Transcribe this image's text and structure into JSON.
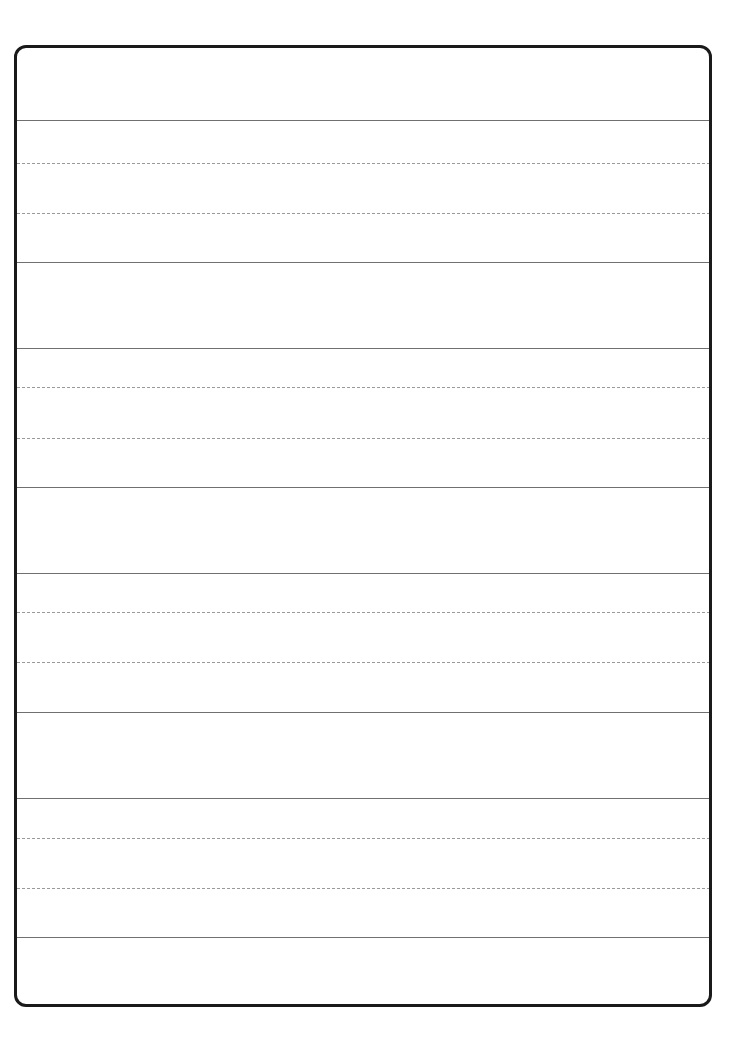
{
  "document": {
    "kind": "handwriting-practice-worksheet",
    "title": "Handwriting Practice Worksheet",
    "page_width": 745,
    "page_height": 1044,
    "background_color": "#ffffff",
    "content_text": ""
  },
  "frame": {
    "name": "worksheet-border",
    "left": 14,
    "top": 45,
    "width": 698,
    "height": 962,
    "border_width": 3,
    "border_color": "#1a1a1a",
    "corner_radius": 12,
    "fill_color": "#ffffff"
  },
  "styles": {
    "solid_rule": {
      "color": "#707070",
      "width": 1,
      "style": "solid"
    },
    "dashed_rule": {
      "color": "#9a9a9a",
      "width": 1,
      "style": "dashed",
      "dash_length": 3,
      "dash_gap": 2
    }
  },
  "rules": [
    {
      "name": "writing-row-1-top",
      "y": 120,
      "style": "solid"
    },
    {
      "name": "writing-row-1-midline-1",
      "y": 163,
      "style": "dashed"
    },
    {
      "name": "writing-row-1-midline-2",
      "y": 213,
      "style": "dashed"
    },
    {
      "name": "writing-row-1-baseline",
      "y": 262,
      "style": "solid"
    },
    {
      "name": "writing-row-2-top",
      "y": 348,
      "style": "solid"
    },
    {
      "name": "writing-row-2-midline-1",
      "y": 387,
      "style": "dashed"
    },
    {
      "name": "writing-row-2-midline-2",
      "y": 438,
      "style": "dashed"
    },
    {
      "name": "writing-row-2-baseline",
      "y": 487,
      "style": "solid"
    },
    {
      "name": "writing-row-3-top",
      "y": 573,
      "style": "solid"
    },
    {
      "name": "writing-row-3-midline-1",
      "y": 612,
      "style": "dashed"
    },
    {
      "name": "writing-row-3-midline-2",
      "y": 662,
      "style": "dashed"
    },
    {
      "name": "writing-row-3-baseline",
      "y": 712,
      "style": "solid"
    },
    {
      "name": "writing-row-4-top",
      "y": 798,
      "style": "solid"
    },
    {
      "name": "writing-row-4-midline-1",
      "y": 838,
      "style": "dashed"
    },
    {
      "name": "writing-row-4-midline-2",
      "y": 888,
      "style": "dashed"
    },
    {
      "name": "writing-row-4-baseline",
      "y": 937,
      "style": "solid"
    }
  ],
  "writing_zones": [
    {
      "name": "blank-header-zone",
      "top": 45,
      "bottom": 120,
      "label": ""
    },
    {
      "name": "writing-zone-1",
      "top": 120,
      "bottom": 262,
      "label": ""
    },
    {
      "name": "spacer-zone-1",
      "top": 262,
      "bottom": 348,
      "label": ""
    },
    {
      "name": "writing-zone-2",
      "top": 348,
      "bottom": 487,
      "label": ""
    },
    {
      "name": "spacer-zone-2",
      "top": 487,
      "bottom": 573,
      "label": ""
    },
    {
      "name": "writing-zone-3",
      "top": 573,
      "bottom": 712,
      "label": ""
    },
    {
      "name": "spacer-zone-3",
      "top": 712,
      "bottom": 798,
      "label": ""
    },
    {
      "name": "writing-zone-4",
      "top": 798,
      "bottom": 937,
      "label": ""
    },
    {
      "name": "blank-footer-zone",
      "top": 937,
      "bottom": 1007,
      "label": ""
    }
  ]
}
